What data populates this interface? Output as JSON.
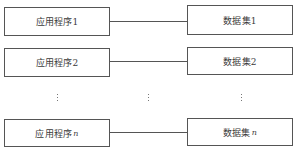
{
  "diagram": {
    "rows": [
      {
        "application": "应用程序1",
        "dataset": "数据集1"
      },
      {
        "application": "应用程序2",
        "dataset": "数据集2"
      },
      {
        "application_prefix": "应用程序",
        "application_suffix": "n",
        "dataset_prefix": "数据集",
        "dataset_suffix": "n"
      }
    ],
    "ellipsis": "⋮",
    "colors": {
      "border": "#555555",
      "text": "#3a3a3a",
      "background": "#ffffff"
    }
  }
}
